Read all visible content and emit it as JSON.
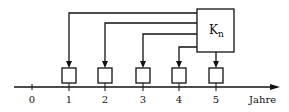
{
  "diagram": {
    "box_label_main": "K",
    "box_label_sub": "n",
    "axis_label": "Jahre",
    "ticks": [
      "0",
      "1",
      "2",
      "3",
      "4",
      "5"
    ],
    "colors": {
      "ink": "#111111",
      "background": "#ffffff"
    }
  }
}
